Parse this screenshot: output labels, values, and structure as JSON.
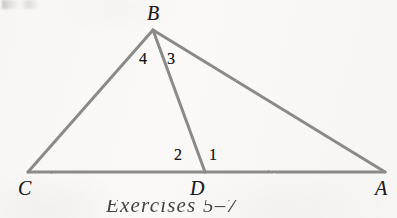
{
  "figure": {
    "kind": "geometry-diagram",
    "background_color": "#faf9f7",
    "stroke_color": "#8a8a8a",
    "stroke_width": 3,
    "text_color": "#1b1b1b",
    "width": 397,
    "height": 218,
    "vertices": [
      {
        "id": "B",
        "label": "B",
        "x": 153,
        "y": 30,
        "label_x": 147,
        "label_y": 3,
        "name": "vertex-label-b"
      },
      {
        "id": "C",
        "label": "C",
        "x": 28,
        "y": 172,
        "label_x": 18,
        "label_y": 178,
        "name": "vertex-label-c"
      },
      {
        "id": "D",
        "label": "D",
        "x": 205,
        "y": 172,
        "label_x": 190,
        "label_y": 178,
        "name": "vertex-label-d"
      },
      {
        "id": "A",
        "label": "A",
        "x": 385,
        "y": 172,
        "label_x": 375,
        "label_y": 178,
        "name": "vertex-label-a"
      }
    ],
    "segments": [
      {
        "id": "CB",
        "from": "C",
        "to": "B",
        "name": "segment-cb"
      },
      {
        "id": "BA",
        "from": "B",
        "to": "A",
        "name": "segment-ba"
      },
      {
        "id": "CA",
        "from": "C",
        "to": "A",
        "name": "segment-ca"
      },
      {
        "id": "BD",
        "from": "B",
        "to": "D",
        "name": "segment-bd"
      }
    ],
    "angle_labels": [
      {
        "id": "4",
        "label": "4",
        "x": 139,
        "y": 51,
        "at_vertex": "B",
        "between": "CB and BD",
        "name": "angle-label-4"
      },
      {
        "id": "3",
        "label": "3",
        "x": 167,
        "y": 51,
        "at_vertex": "B",
        "between": "BD and BA",
        "name": "angle-label-3"
      },
      {
        "id": "2",
        "label": "2",
        "x": 174,
        "y": 147,
        "at_vertex": "D",
        "between": "DC and DB",
        "name": "angle-label-2"
      },
      {
        "id": "1",
        "label": "1",
        "x": 209,
        "y": 147,
        "at_vertex": "D",
        "between": "DB and DA",
        "name": "angle-label-1"
      }
    ]
  },
  "caption": {
    "text": "Exercises 5–7",
    "clipped": true
  }
}
